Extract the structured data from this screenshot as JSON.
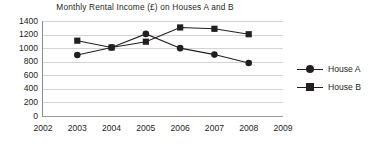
{
  "chart_data": {
    "type": "line",
    "title": "Monthly Rental Income (£) on Houses A and B",
    "xlabel": "",
    "ylabel": "",
    "x": [
      2002,
      2003,
      2004,
      2005,
      2006,
      2007,
      2008,
      2009
    ],
    "xtick_labels": [
      "2002",
      "2003",
      "2004",
      "2005",
      "2006",
      "2007",
      "2008",
      "2009"
    ],
    "xlim": [
      2002,
      2009
    ],
    "ylim": [
      0,
      1400
    ],
    "ytick_labels": [
      "1400",
      "1200",
      "1000",
      "800",
      "600",
      "400",
      "200",
      "0"
    ],
    "ytick_values": [
      1400,
      1200,
      1000,
      800,
      600,
      400,
      200,
      0
    ],
    "grid": true,
    "legend_position": "right",
    "series": [
      {
        "name": "House A",
        "marker": "circle",
        "color": "#231f20",
        "x": [
          2003,
          2004,
          2005,
          2006,
          2007,
          2008
        ],
        "values": [
          900,
          1010,
          1210,
          1000,
          905,
          780
        ]
      },
      {
        "name": "House B",
        "marker": "square",
        "color": "#231f20",
        "x": [
          2003,
          2004,
          2005,
          2006,
          2007,
          2008
        ],
        "values": [
          1110,
          1010,
          1095,
          1305,
          1285,
          1205
        ]
      }
    ]
  },
  "legend": {
    "items": [
      {
        "label": "House A",
        "marker": "circle-marker"
      },
      {
        "label": "House B",
        "marker": "square-marker"
      }
    ]
  }
}
